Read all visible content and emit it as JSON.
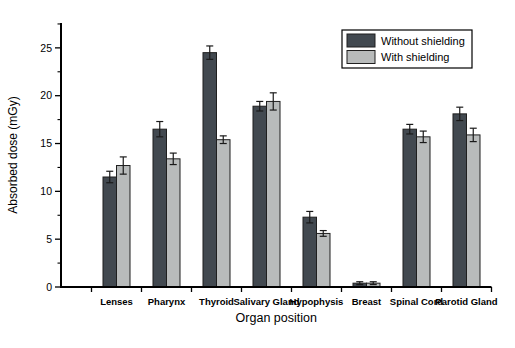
{
  "figure": {
    "background": "#ffffff"
  },
  "chart_data": {
    "type": "bar",
    "title": "",
    "xlabel": "Organ position",
    "ylabel": "Absorbed dose (mGy)",
    "ylim": [
      0,
      27.6
    ],
    "y_major_ticks": [
      0,
      5,
      10,
      15,
      20,
      25
    ],
    "y_minor_step": 2.5,
    "grid": false,
    "legend_position": "top-right",
    "categories": [
      "Lenses",
      "Pharynx",
      "Thyroid",
      "Salivary Gland",
      "Hypophysis",
      "Breast",
      "Spinal Cord",
      "Parotid Gland"
    ],
    "series": [
      {
        "name": "Without shielding",
        "color": "#424950",
        "values": [
          11.5,
          16.5,
          24.5,
          18.9,
          7.3,
          0.4,
          16.5,
          18.1
        ],
        "errors": [
          0.6,
          0.8,
          0.7,
          0.5,
          0.6,
          0.15,
          0.5,
          0.7
        ]
      },
      {
        "name": "With shielding",
        "color": "#b8bbbb",
        "values": [
          12.7,
          13.4,
          15.4,
          19.4,
          5.6,
          0.4,
          15.7,
          15.9
        ],
        "errors": [
          0.9,
          0.6,
          0.4,
          0.9,
          0.3,
          0.15,
          0.6,
          0.7
        ]
      }
    ],
    "colors": {
      "axis": "#000000",
      "error_bar": "#1a1a1a",
      "bar_outline": "#1f1f1f",
      "legend_border": "#000000",
      "legend_bg": "#ffffff"
    }
  }
}
